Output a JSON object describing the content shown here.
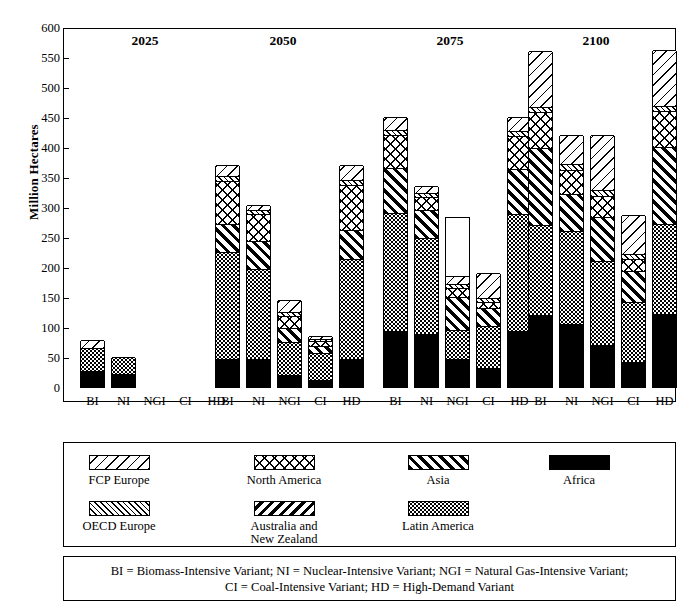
{
  "chart_data": {
    "type": "bar",
    "title": "",
    "subtitle": "",
    "xlabel": "",
    "ylabel": "Million Hectares",
    "ylim": [
      0,
      600
    ],
    "ytick_step": 50,
    "yticks": [
      0,
      50,
      100,
      150,
      200,
      250,
      300,
      350,
      400,
      450,
      500,
      550,
      600
    ],
    "grid": false,
    "stacked": true,
    "legend_position": "below-plot",
    "group_labels": [
      "2025",
      "2050",
      "2075",
      "2100"
    ],
    "categories": [
      "BI",
      "NI",
      "NGI",
      "CI",
      "HD"
    ],
    "series_order_bottom_to_top": [
      "Africa",
      "Latin America",
      "Asia",
      "North America",
      "OECD Europe",
      "FCP Europe"
    ],
    "series": [
      {
        "name": "Africa",
        "pattern": "solid-black",
        "values": {
          "2025": [
            27,
            22,
            0,
            0,
            0
          ],
          "2050": [
            47,
            46,
            20,
            12,
            47
          ],
          "2075": [
            93,
            88,
            47,
            32,
            94
          ],
          "2100": [
            120,
            105,
            70,
            42,
            121
          ]
        }
      },
      {
        "name": "Latin America",
        "pattern": "fine-dot-stipple",
        "values": {
          "2025": [
            38,
            28,
            0,
            0,
            0
          ],
          "2050": [
            178,
            150,
            55,
            45,
            167
          ],
          "2075": [
            197,
            160,
            48,
            70,
            194
          ],
          "2100": [
            150,
            155,
            140,
            100,
            151
          ]
        }
      },
      {
        "name": "Asia",
        "pattern": "thick-forward-diagonal",
        "values": {
          "2025": [
            0,
            0,
            0,
            0,
            0
          ],
          "2050": [
            47,
            47,
            23,
            12,
            48
          ],
          "2075": [
            75,
            47,
            55,
            30,
            75
          ],
          "2100": [
            128,
            62,
            73,
            52,
            128
          ]
        }
      },
      {
        "name": "North America",
        "pattern": "cross-hatch",
        "values": {
          "2025": [
            0,
            0,
            0,
            0,
            0
          ],
          "2050": [
            72,
            45,
            20,
            8,
            75
          ],
          "2075": [
            55,
            22,
            15,
            10,
            55
          ],
          "2100": [
            60,
            40,
            35,
            20,
            60
          ]
        }
      },
      {
        "name": "OECD Europe",
        "pattern": "dense-thin-forward-diagonal",
        "values": {
          "2025": [
            0,
            0,
            0,
            0,
            0
          ],
          "2050": [
            8,
            7,
            7,
            3,
            8
          ],
          "2075": [
            8,
            7,
            7,
            6,
            8
          ],
          "2100": [
            8,
            10,
            10,
            7,
            8
          ]
        }
      },
      {
        "name": "FCP Europe",
        "pattern": "wide-back-diagonal",
        "values": {
          "2025": [
            13,
            0,
            0,
            0,
            0
          ],
          "2050": [
            18,
            8,
            20,
            5,
            25
          ],
          "2075": [
            22,
            11,
            13,
            42,
            24
          ],
          "2100": [
            94,
            48,
            92,
            66,
            94
          ]
        }
      },
      {
        "name": "Australia and New Zealand",
        "pattern": "thick-back-diagonal",
        "values": {
          "2025": [
            0,
            0,
            0,
            0,
            0
          ],
          "2050": [
            0,
            0,
            0,
            0,
            0
          ],
          "2075": [
            0,
            0,
            0,
            0,
            0
          ],
          "2100": [
            0,
            0,
            0,
            0,
            0
          ]
        }
      }
    ],
    "totals": {
      "2025": [
        78,
        50,
        0,
        0,
        0
      ],
      "2050": [
        370,
        303,
        145,
        85,
        370
      ],
      "2075": [
        450,
        335,
        285,
        190,
        450
      ],
      "2100": [
        560,
        420,
        420,
        287,
        562
      ]
    }
  },
  "axis": {
    "y_title": "Million Hectares",
    "y_tick_labels": [
      "600",
      "550",
      "500",
      "450",
      "400",
      "350",
      "300",
      "250",
      "200",
      "150",
      "100",
      "50",
      "0"
    ],
    "x_tick_labels": [
      "BI",
      "NI",
      "NGI",
      "CI",
      "HD"
    ]
  },
  "periods": [
    {
      "label": "2025"
    },
    {
      "label": "2050"
    },
    {
      "label": "2075"
    },
    {
      "label": "2100"
    }
  ],
  "legend": {
    "row1": [
      {
        "label": "FCP Europe",
        "pattern": "wide-back-diagonal"
      },
      {
        "label": "North America",
        "pattern": "cross-hatch"
      },
      {
        "label": "Asia",
        "pattern": "thick-forward-diagonal"
      },
      {
        "label": "Africa",
        "pattern": "solid-black"
      }
    ],
    "row2": [
      {
        "label": "OECD Europe",
        "pattern": "dense-thin-forward-diagonal"
      },
      {
        "label": "Australia and\nNew Zealand",
        "pattern": "thick-back-diagonal"
      },
      {
        "label": "Latin America",
        "pattern": "fine-dot-stipple"
      }
    ]
  },
  "note": {
    "line1": "BI = Biomass-Intensive Variant; NI = Nuclear-Intensive Variant; NGI = Natural Gas-Intensive Variant;",
    "line2": "CI = Coal-Intensive Variant; HD = High-Demand Variant"
  }
}
